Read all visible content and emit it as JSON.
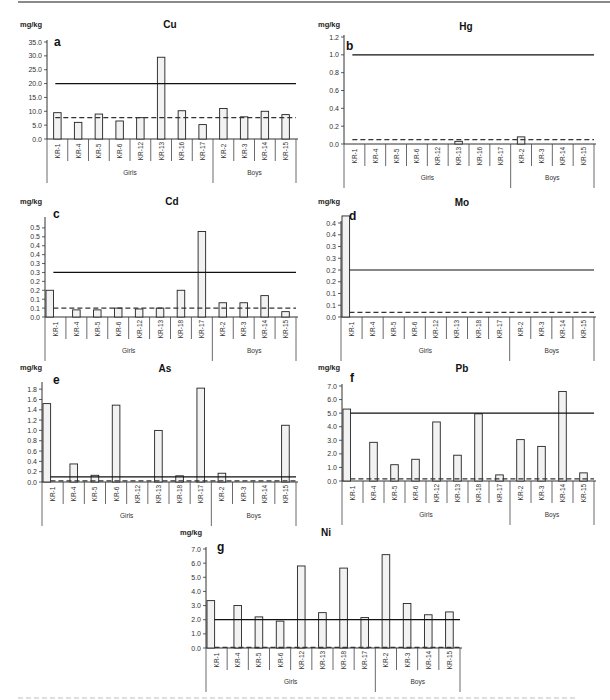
{
  "figure": {
    "caption_visible": false
  },
  "chart_data": [
    {
      "id": "a",
      "panel_label": "a",
      "type": "bar",
      "title": "Cu",
      "ylabel": "mg/kg",
      "xlabel": "",
      "categories": [
        "KR-1",
        "KR-4",
        "KR-5",
        "KR-6",
        "KR-12",
        "KR-13",
        "KR-16",
        "KR-17",
        "KR-2",
        "KR-3",
        "KR-14",
        "KR-15"
      ],
      "groups": [
        {
          "name": "Girls",
          "count": 8
        },
        {
          "name": "Boys",
          "count": 4
        }
      ],
      "values": [
        9.5,
        6.0,
        9.0,
        6.5,
        7.7,
        29.5,
        10.2,
        5.2,
        11.0,
        8.0,
        10.0,
        8.8
      ],
      "yticks": [
        "0.0",
        "5.0",
        "10.0",
        "15.0",
        "20.0",
        "25.0",
        "30.0",
        "35.0"
      ],
      "ylim": [
        0,
        35
      ],
      "reference_lines": [
        {
          "style": "solid",
          "value": 20.0
        },
        {
          "style": "dashed",
          "value": 7.7
        }
      ],
      "grid": false,
      "legend": "none",
      "layout": {
        "x": 47,
        "top": 42,
        "base": 139,
        "right": 296,
        "title_x": 170,
        "title_y": 28,
        "unit_x": 20,
        "unit_y": 27,
        "label_x": 54,
        "label_y": 46
      }
    },
    {
      "id": "b",
      "panel_label": "b",
      "type": "bar",
      "title": "Hg",
      "ylabel": "mg/kg",
      "xlabel": "",
      "categories": [
        "KR-1",
        "KR-4",
        "KR-5",
        "KR-6",
        "KR-12",
        "KR-13",
        "KR-16",
        "KR-17",
        "KR-2",
        "KR-3",
        "KR-14",
        "KR-15"
      ],
      "groups": [
        {
          "name": "Girls",
          "count": 8
        },
        {
          "name": "Boys",
          "count": 4
        }
      ],
      "values": [
        0,
        0,
        0,
        0,
        0,
        0.03,
        0,
        0,
        0.08,
        0,
        0,
        0
      ],
      "yticks": [
        "0.0",
        "0.2",
        "0.4",
        "0.6",
        "0.8",
        "1.0",
        "1.2"
      ],
      "ylim": [
        0,
        1.2
      ],
      "reference_lines": [
        {
          "style": "solid",
          "value": 1.0
        },
        {
          "style": "dashed",
          "value": 0.05
        }
      ],
      "grid": false,
      "legend": "none",
      "layout": {
        "x": 344,
        "top": 37,
        "base": 144,
        "right": 594,
        "title_x": 466,
        "title_y": 30,
        "unit_x": 318,
        "unit_y": 27,
        "label_x": 346,
        "label_y": 50
      }
    },
    {
      "id": "c",
      "panel_label": "c",
      "type": "bar",
      "title": "Cd",
      "ylabel": "mg/kg",
      "xlabel": "",
      "categories": [
        "KR-1",
        "KR-4",
        "KR-5",
        "KR-6",
        "KR-12",
        "KR-13",
        "KR-18",
        "KR-17",
        "KR-2",
        "KR-3",
        "KR-14",
        "KR-15"
      ],
      "groups": [
        {
          "name": "Girls",
          "count": 8
        },
        {
          "name": "Boys",
          "count": 4
        }
      ],
      "values": [
        0.15,
        0.04,
        0.04,
        0.05,
        0.045,
        0.05,
        0.15,
        0.48,
        0.08,
        0.08,
        0.12,
        0.03
      ],
      "yticks": [
        "0.0",
        "0.1",
        "0.1",
        "0.2",
        "0.2",
        "0.3",
        "0.3",
        "0.4",
        "0.4",
        "0.5",
        "0.5"
      ],
      "ylim": [
        0,
        0.55
      ],
      "reference_lines": [
        {
          "style": "solid",
          "value": 0.25
        },
        {
          "style": "dashed",
          "value": 0.05
        }
      ],
      "grid": false,
      "legend": "none",
      "layout": {
        "x": 45,
        "top": 219,
        "base": 317,
        "right": 296,
        "title_x": 172,
        "title_y": 205,
        "unit_x": 20,
        "unit_y": 204,
        "label_x": 53,
        "label_y": 218
      }
    },
    {
      "id": "d",
      "panel_label": "d",
      "type": "bar",
      "title": "Mo",
      "ylabel": "mg/kg",
      "xlabel": "",
      "categories": [
        "KR-1",
        "KR-4",
        "KR-5",
        "KR-6",
        "KR-12",
        "KR-13",
        "KR-18",
        "KR-17",
        "KR-2",
        "KR-3",
        "KR-14",
        "KR-15"
      ],
      "groups": [
        {
          "name": "Girls",
          "count": 8
        },
        {
          "name": "Boys",
          "count": 4
        }
      ],
      "values": [
        0.43,
        0,
        0,
        0,
        0,
        0,
        0,
        0,
        0,
        0,
        0,
        0
      ],
      "yticks": [
        "0.0",
        "0.1",
        "0.1",
        "0.2",
        "0.2",
        "0.3",
        "0.3",
        "0.4",
        "0.4"
      ],
      "ylim": [
        0,
        0.4
      ],
      "reference_lines": [
        {
          "style": "solid",
          "value": 0.2
        },
        {
          "style": "dashed",
          "value": 0.02
        }
      ],
      "grid": false,
      "legend": "none",
      "layout": {
        "x": 341,
        "top": 223,
        "base": 317,
        "right": 594,
        "title_x": 462,
        "title_y": 206,
        "unit_x": 318,
        "unit_y": 204,
        "label_x": 349,
        "label_y": 220
      }
    },
    {
      "id": "e",
      "panel_label": "e",
      "type": "bar",
      "title": "As",
      "ylabel": "mg/kg",
      "xlabel": "",
      "categories": [
        "KR-1",
        "KR-4",
        "KR-5",
        "KR-6",
        "KR-12",
        "KR-13",
        "KR-18",
        "KR-17",
        "KR-2",
        "KR-3",
        "KR-14",
        "KR-15"
      ],
      "groups": [
        {
          "name": "Girls",
          "count": 8
        },
        {
          "name": "Boys",
          "count": 4
        }
      ],
      "values": [
        1.52,
        0.35,
        0.13,
        1.49,
        0,
        1.0,
        0.12,
        1.82,
        0.17,
        0,
        0,
        1.1
      ],
      "yticks": [
        "0.0",
        "0.2",
        "0.4",
        "0.6",
        "0.8",
        "1.0",
        "1.2",
        "1.4",
        "1.6",
        "1.8"
      ],
      "ylim": [
        0,
        1.9
      ],
      "reference_lines": [
        {
          "style": "solid",
          "value": 0.1
        },
        {
          "style": "dashed",
          "value": 0.02
        }
      ],
      "grid": false,
      "legend": "none",
      "layout": {
        "x": 42,
        "top": 384,
        "base": 482,
        "right": 296,
        "title_x": 165,
        "title_y": 372,
        "unit_x": 20,
        "unit_y": 370,
        "label_x": 53,
        "label_y": 384
      }
    },
    {
      "id": "f",
      "panel_label": "f",
      "type": "bar",
      "title": "Pb",
      "ylabel": "mg/kg",
      "xlabel": "",
      "categories": [
        "KR-1",
        "KR-4",
        "KR-5",
        "KR-6",
        "KR-12",
        "KR-13",
        "KR-18",
        "KR-17",
        "KR-2",
        "KR-3",
        "KR-14",
        "KR-15"
      ],
      "groups": [
        {
          "name": "Girls",
          "count": 8
        },
        {
          "name": "Boys",
          "count": 4
        }
      ],
      "values": [
        5.3,
        2.85,
        1.2,
        1.6,
        4.35,
        1.9,
        4.95,
        0.45,
        3.05,
        2.55,
        6.6,
        0.6
      ],
      "yticks": [
        "0.0",
        "1.0",
        "2.0",
        "3.0",
        "4.0",
        "5.0",
        "6.0",
        "7.0"
      ],
      "ylim": [
        0,
        7
      ],
      "reference_lines": [
        {
          "style": "solid",
          "value": 5.0
        },
        {
          "style": "dashed",
          "value": 0.15
        }
      ],
      "grid": false,
      "legend": "none",
      "layout": {
        "x": 342,
        "top": 386,
        "base": 481,
        "right": 594,
        "title_x": 462,
        "title_y": 372,
        "unit_x": 318,
        "unit_y": 370,
        "label_x": 350,
        "label_y": 382
      }
    },
    {
      "id": "g",
      "panel_label": "g",
      "type": "bar",
      "title": "Ni",
      "ylabel": "mg/kg",
      "xlabel": "",
      "categories": [
        "KR-1",
        "KR-4",
        "KR-5",
        "KR-6",
        "KR-12",
        "KR-13",
        "KR-18",
        "KR-17",
        "KR-2",
        "KR-3",
        "KR-14",
        "KR-15"
      ],
      "groups": [
        {
          "name": "Girls",
          "count": 8
        },
        {
          "name": "Boys",
          "count": 4
        }
      ],
      "values": [
        3.35,
        3.0,
        2.2,
        1.9,
        5.8,
        2.5,
        5.65,
        2.15,
        6.6,
        3.15,
        2.35,
        2.55
      ],
      "yticks": [
        "0.0",
        "1.0",
        "2.0",
        "3.0",
        "4.0",
        "5.0",
        "6.0",
        "7.0"
      ],
      "ylim": [
        0,
        7
      ],
      "reference_lines": [
        {
          "style": "solid",
          "value": 2.0
        },
        {
          "style": "dashed",
          "value": 0.05
        }
      ],
      "grid": false,
      "legend": "none",
      "layout": {
        "x": 206,
        "top": 549,
        "base": 648,
        "right": 460,
        "title_x": 326,
        "title_y": 536,
        "unit_x": 180,
        "unit_y": 535,
        "label_x": 217,
        "label_y": 551
      }
    }
  ]
}
